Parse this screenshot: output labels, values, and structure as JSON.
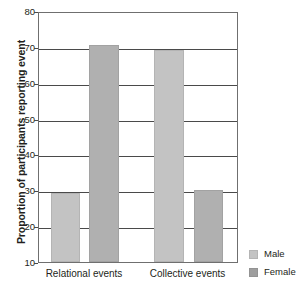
{
  "chart_data": {
    "type": "bar",
    "title": "",
    "xlabel": "",
    "ylabel": "Proportion of participants reporting event",
    "categories": [
      "Relational events",
      "Collective events"
    ],
    "series": [
      {
        "name": "Male",
        "values": [
          29.3,
          69.0
        ],
        "color": "#c3c3c3"
      },
      {
        "name": "Female",
        "values": [
          70.5,
          30.2
        ],
        "color": "#b0b0b0"
      }
    ],
    "ylim": [
      10,
      80
    ],
    "yticks": [
      10,
      20,
      30,
      40,
      50,
      60,
      70,
      80
    ],
    "ytick_labels": [
      "10",
      "20",
      "30",
      "40",
      "50",
      "60",
      "70",
      "80"
    ],
    "grid": "horizontal",
    "legend_position": "right-bottom"
  },
  "axis": {
    "y_title": "Proportion of participants reporting event",
    "ticks": [
      {
        "label": "80",
        "value": 80
      },
      {
        "label": "70",
        "value": 70
      },
      {
        "label": "60",
        "value": 60
      },
      {
        "label": "50",
        "value": 50
      },
      {
        "label": "40",
        "value": 40
      },
      {
        "label": "30",
        "value": 30
      },
      {
        "label": "20",
        "value": 20
      },
      {
        "label": "10",
        "value": 10
      }
    ],
    "x_categories": [
      {
        "label": "Relational events"
      },
      {
        "label": "Collective events"
      }
    ]
  },
  "legend": {
    "items": [
      {
        "label": "Male",
        "color": "#c3c3c3"
      },
      {
        "label": "Female",
        "color": "#9e9e9e"
      }
    ]
  },
  "bars": [
    {
      "name": "relational-male",
      "group": "Relational events",
      "series": "Male",
      "value": 29.3
    },
    {
      "name": "relational-female",
      "group": "Relational events",
      "series": "Female",
      "value": 70.5
    },
    {
      "name": "collective-male",
      "group": "Collective events",
      "series": "Male",
      "value": 69.0
    },
    {
      "name": "collective-female",
      "group": "Collective events",
      "series": "Female",
      "value": 30.2
    }
  ]
}
